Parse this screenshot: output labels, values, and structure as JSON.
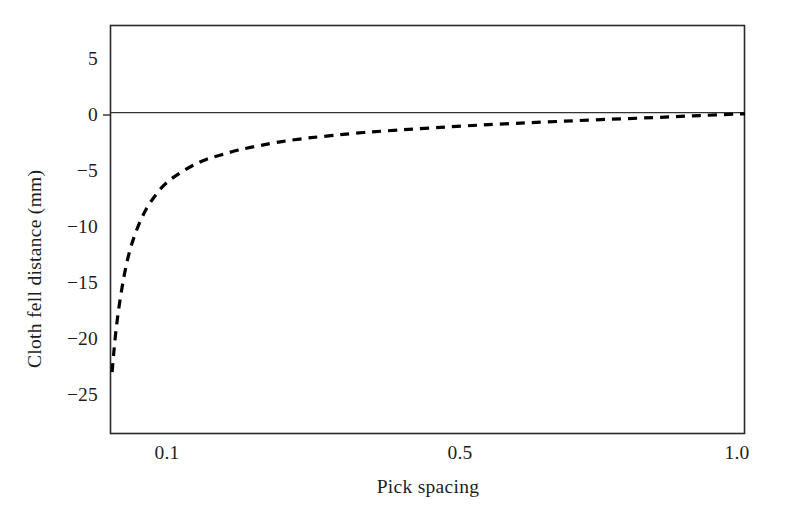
{
  "chart_data": {
    "type": "line",
    "title": "",
    "xlabel": "Pick spacing",
    "ylabel": "Cloth fell distance (mm)",
    "xlim": [
      0.0875,
      1.0
    ],
    "ylim": [
      -27.5,
      7.5
    ],
    "xticks": [
      0.1,
      0.5,
      1.0
    ],
    "xticklabels": [
      "0.1",
      "0.5",
      "1.0"
    ],
    "yticks": [
      5,
      0,
      -5,
      -10,
      -15,
      -20,
      -25
    ],
    "yticklabels": [
      "5",
      "0",
      "−5",
      "−10",
      "−15",
      "−20",
      "−25"
    ],
    "grid": false,
    "legend": null,
    "series": [
      {
        "name": "Cloth fell distance",
        "linestyle": "dashed",
        "linewidth": 3.2,
        "color": "#000000",
        "x": [
          0.0905,
          0.093,
          0.096,
          0.1,
          0.105,
          0.11,
          0.116,
          0.123,
          0.131,
          0.14,
          0.15,
          0.162,
          0.175,
          0.19,
          0.207,
          0.226,
          0.248,
          0.272,
          0.3,
          0.332,
          0.368,
          0.408,
          0.452,
          0.5,
          0.552,
          0.608,
          0.668,
          0.732,
          0.8,
          0.87,
          0.935,
          1.0
        ],
        "y": [
          -22.2,
          -20.5,
          -18.7,
          -16.8,
          -14.9,
          -13.3,
          -11.8,
          -10.5,
          -9.3,
          -8.2,
          -7.3,
          -6.4,
          -5.7,
          -5.1,
          -4.5,
          -4.0,
          -3.6,
          -3.2,
          -2.85,
          -2.5,
          -2.2,
          -1.95,
          -1.7,
          -1.5,
          -1.3,
          -1.1,
          -0.92,
          -0.75,
          -0.58,
          -0.42,
          -0.25,
          -0.1
        ]
      }
    ],
    "reference_lines": [
      {
        "name": "zero-line",
        "orientation": "horizontal",
        "value": 0,
        "color": "#333333",
        "linewidth": 1.2
      }
    ]
  },
  "axes": {
    "frame_color": "#2a2a2a",
    "frame_linewidth": 1.6,
    "background": "#ffffff"
  },
  "ylabel_text": "Cloth fell distance (mm)",
  "xlabel_text": "Pick spacing",
  "ytick_labels": [
    "5",
    "0",
    "−5",
    "−10",
    "−15",
    "−20",
    "−25"
  ],
  "xtick_labels": [
    "0.1",
    "0.5",
    "1.0"
  ]
}
